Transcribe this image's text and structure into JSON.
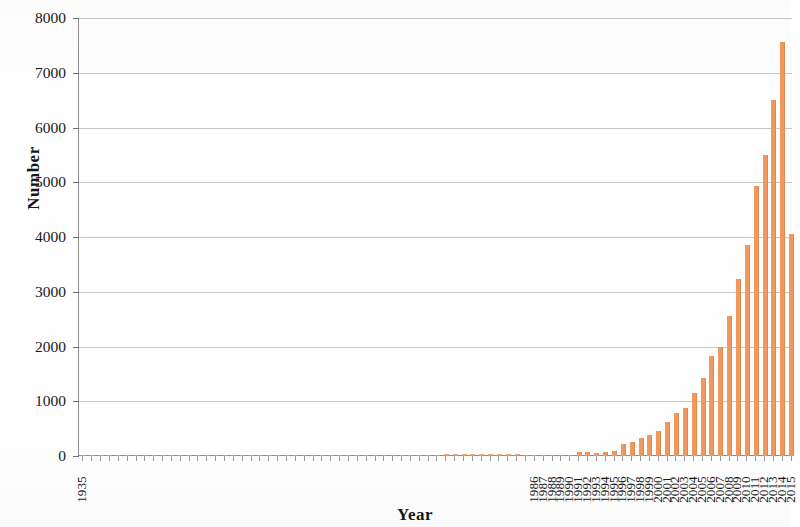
{
  "chart_data": {
    "type": "bar",
    "title": "",
    "xlabel": "Year",
    "ylabel": "Number",
    "ylim": [
      0,
      8000
    ],
    "ytick_step": 1000,
    "yticks": [
      0,
      1000,
      2000,
      3000,
      4000,
      5000,
      6000,
      7000,
      8000
    ],
    "ytick_labels": [
      "0",
      "1000",
      "2000",
      "3000",
      "4000",
      "5000",
      "6000",
      "7000",
      "8000"
    ],
    "grid": "horizontal",
    "legend": "none",
    "bar_color": "#F0985D",
    "axis_color": "#8D8D8D",
    "gridline_color": "#B9B9B9",
    "last_category_clipped": true,
    "categories": [
      "1935",
      "1936",
      "1937",
      "1938",
      "1939",
      "1940",
      "1941",
      "1942",
      "1943",
      "1944",
      "1945",
      "1946",
      "1947",
      "1948",
      "1949",
      "1950",
      "1951",
      "1952",
      "1953",
      "1954",
      "1955",
      "1956",
      "1957",
      "1958",
      "1959",
      "1960",
      "1961",
      "1962",
      "1963",
      "1964",
      "1965",
      "1966",
      "1967",
      "1968",
      "1969",
      "1970",
      "1971",
      "1972",
      "1973",
      "1974",
      "1975",
      "1976",
      "1977",
      "1978",
      "1979",
      "1980",
      "1981",
      "1982",
      "1983",
      "1984",
      "1985",
      "1986",
      "1987",
      "1988",
      "1989",
      "1990",
      "1991",
      "1992",
      "1993",
      "1994",
      "1995",
      "1996",
      "1997",
      "1998",
      "1999",
      "2000",
      "2001",
      "2002",
      "2003",
      "2004",
      "2005",
      "2006",
      "2007",
      "2008",
      "2009",
      "2010",
      "2011",
      "2012",
      "2013",
      "2014",
      "2015"
    ],
    "visible_categories": [
      "1935",
      "1986",
      "1987",
      "1988",
      "1989",
      "1990",
      "1991",
      "1992",
      "1993",
      "1994",
      "1995",
      "1996",
      "1997",
      "1998",
      "1999",
      "2000",
      "2001",
      "2002",
      "2003",
      "2004",
      "2005",
      "2006",
      "2007",
      "2008",
      "2009",
      "2010",
      "2011",
      "2012",
      "2013",
      "2014",
      "2015"
    ],
    "values": [
      3,
      3,
      4,
      4,
      5,
      5,
      6,
      6,
      7,
      7,
      8,
      8,
      9,
      9,
      10,
      10,
      11,
      12,
      12,
      13,
      14,
      14,
      15,
      16,
      16,
      17,
      18,
      18,
      19,
      20,
      20,
      21,
      22,
      22,
      23,
      24,
      24,
      25,
      26,
      26,
      27,
      28,
      28,
      29,
      30,
      30,
      31,
      32,
      32,
      33,
      12,
      14,
      16,
      18,
      20,
      25,
      65,
      78,
      62,
      72,
      88,
      215,
      248,
      320,
      392,
      455,
      620,
      780,
      880,
      1150,
      1420,
      1820,
      2000,
      2550,
      3240,
      3850,
      4930,
      5500,
      6500,
      7570,
      4050
    ]
  },
  "axis_titles": {
    "y": "Number",
    "x": "Year"
  }
}
